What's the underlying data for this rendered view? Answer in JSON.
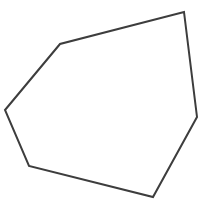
{
  "figure": {
    "background_color": "#ffffff",
    "width": 203,
    "height": 219
  },
  "shape": {
    "name": "hexagon",
    "sides": 6,
    "stroke_color": "#3d3d3d",
    "fill_color": "#ffffff",
    "stroke_width": 2,
    "points": "184,12 197,117 153,197 29,166 5,110 60,44",
    "vertices": [
      {
        "label": "top-right",
        "x": 184,
        "y": 12
      },
      {
        "label": "right",
        "x": 197,
        "y": 117
      },
      {
        "label": "bottom-right",
        "x": 153,
        "y": 197
      },
      {
        "label": "bottom-left",
        "x": 29,
        "y": 166
      },
      {
        "label": "left",
        "x": 5,
        "y": 110
      },
      {
        "label": "upper-left",
        "x": 60,
        "y": 44
      }
    ]
  }
}
